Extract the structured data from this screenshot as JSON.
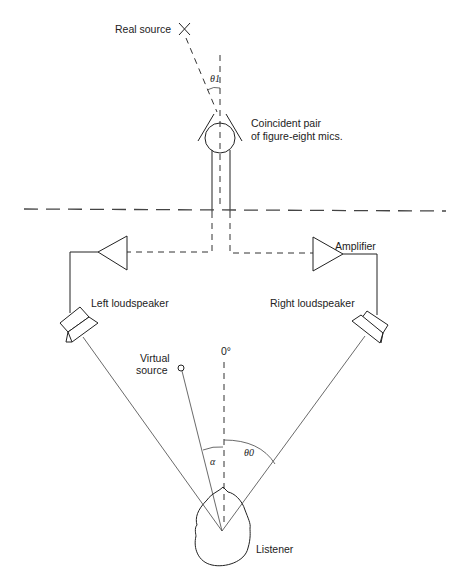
{
  "diagram": {
    "labels": {
      "real_source": "Real source",
      "theta_1": "θ1",
      "mics_line1": "Coincident pair",
      "mics_line2": "of figure-eight mics.",
      "amplifier": "Amplifier",
      "left_loudspeaker": "Left loudspeaker",
      "right_loudspeaker": "Right loudspeaker",
      "virtual_source_line1": "Virtual",
      "virtual_source_line2": "source",
      "zero_degrees": "0°",
      "alpha": "α",
      "theta_0": "θ0",
      "listener": "Listener"
    },
    "nodes": [
      {
        "id": "real-source",
        "label": "Real source",
        "shape": "cross"
      },
      {
        "id": "mic-pair",
        "label": "Coincident pair of figure-eight mics.",
        "shape": "circle"
      },
      {
        "id": "left-amp",
        "label": "",
        "shape": "triangle"
      },
      {
        "id": "right-amp",
        "label": "Amplifier",
        "shape": "triangle"
      },
      {
        "id": "left-speaker",
        "label": "Left loudspeaker",
        "shape": "speaker"
      },
      {
        "id": "right-speaker",
        "label": "Right loudspeaker",
        "shape": "speaker"
      },
      {
        "id": "virtual-source",
        "label": "Virtual source",
        "shape": "small-circle"
      },
      {
        "id": "listener",
        "label": "Listener",
        "shape": "head"
      }
    ],
    "edges": [
      {
        "from": "real-source",
        "to": "mic-pair",
        "style": "dashed",
        "angle": "θ1"
      },
      {
        "from": "mic-pair",
        "to": "left-amp",
        "style": "solid-then-dashed"
      },
      {
        "from": "mic-pair",
        "to": "right-amp",
        "style": "solid-then-dashed"
      },
      {
        "from": "left-amp",
        "to": "left-speaker",
        "style": "solid"
      },
      {
        "from": "right-amp",
        "to": "right-speaker",
        "style": "solid"
      },
      {
        "from": "left-speaker",
        "to": "listener",
        "style": "thin"
      },
      {
        "from": "right-speaker",
        "to": "listener",
        "style": "thin",
        "angle": "θ0"
      },
      {
        "from": "virtual-source",
        "to": "listener",
        "style": "thin",
        "angle": "α"
      }
    ]
  }
}
